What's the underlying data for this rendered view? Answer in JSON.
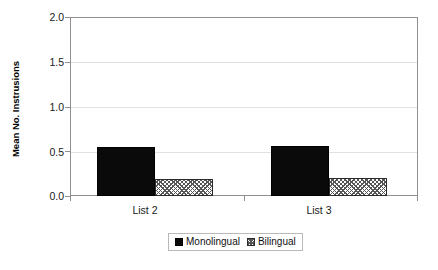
{
  "chart_data": {
    "type": "bar",
    "title": "",
    "xlabel": "",
    "ylabel": "Mean No. Instrusions",
    "categories": [
      "List 2",
      "List 3"
    ],
    "series": [
      {
        "name": "Monolingual",
        "values": [
          0.55,
          0.56
        ],
        "fill": "solid-black",
        "color": "#0a0a0a"
      },
      {
        "name": "Bilingual",
        "values": [
          0.19,
          0.2
        ],
        "fill": "diagonal-crosshatch",
        "color": "#555555"
      }
    ],
    "ylim": [
      0.0,
      2.0
    ],
    "yticks": [
      "0.0",
      "0.5",
      "1.0",
      "1.5",
      "2.0"
    ],
    "ytick_values": [
      0.0,
      0.5,
      1.0,
      1.5,
      2.0
    ],
    "grid": true,
    "grid_axis": "y",
    "legend_position": "bottom"
  },
  "axes": {
    "y_title": "Mean No. Instrusions",
    "y_ticks": [
      {
        "label": "2.0",
        "value": 2.0
      },
      {
        "label": "1.5",
        "value": 1.5
      },
      {
        "label": "1.0",
        "value": 1.0
      },
      {
        "label": "0.5",
        "value": 0.5
      },
      {
        "label": "0.0",
        "value": 0.0
      }
    ],
    "x_ticks": [
      {
        "label": "List 2"
      },
      {
        "label": "List 3"
      }
    ]
  },
  "legend": {
    "entries": [
      {
        "label": "Monolingual",
        "swatch": "solid-square-icon"
      },
      {
        "label": "Bilingual",
        "swatch": "hatched-square-icon"
      }
    ]
  }
}
